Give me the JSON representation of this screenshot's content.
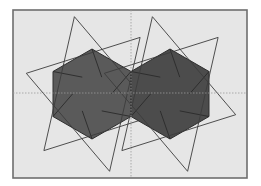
{
  "diagram": {
    "title": "",
    "colors": {
      "background": "#e6e6e6",
      "frame": "#6e6e6e",
      "hexagon_fill": "#555555",
      "lines": "#3c3c3c",
      "guides": "#9a9a9a"
    },
    "figures": [
      {
        "name": "left-hexagon-group",
        "shape": "hexagon",
        "triangles": 2
      },
      {
        "name": "right-hexagon-group",
        "shape": "hexagon",
        "triangles": 2
      }
    ],
    "guides": [
      "vertical-center",
      "horizontal-center"
    ]
  }
}
